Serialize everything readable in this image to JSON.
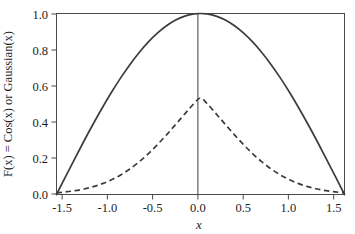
{
  "chart_data": {
    "type": "line",
    "title": "",
    "subtitle": "",
    "xlabel": "x",
    "ylabel": "F(x) = Cos(x) or Gaussian(x)",
    "xlim": [
      -1.5708,
      1.5708
    ],
    "ylim": [
      0.0,
      1.0
    ],
    "grid": false,
    "legend": "none",
    "xticks": [
      -1.5,
      -1.0,
      -0.5,
      0.0,
      0.5,
      1.0,
      1.5
    ],
    "xtick_labels": [
      "-1.5",
      "-1.0",
      "-0.5",
      "0.0",
      "0.5",
      "1.0",
      "1.5"
    ],
    "yticks": [
      0.0,
      0.2,
      0.4,
      0.6,
      0.8,
      1.0
    ],
    "ytick_labels": [
      "0.0",
      "0.2",
      "0.4",
      "0.6",
      "0.8",
      "1.0"
    ],
    "annotations": [
      {
        "name": "vertical-line-at-zero",
        "x": 0.0,
        "style": "solid"
      }
    ],
    "series": [
      {
        "name": "Cos(x)",
        "style": "solid",
        "color": "#3b3b42",
        "x": [
          -1.5708,
          -1.4708,
          -1.3708,
          -1.2708,
          -1.1708,
          -1.0708,
          -0.9708,
          -0.8708,
          -0.7708,
          -0.6708,
          -0.5708,
          -0.4708,
          -0.3708,
          -0.2708,
          -0.1708,
          -0.0708,
          0.0,
          0.0708,
          0.1708,
          0.2708,
          0.3708,
          0.4708,
          0.5708,
          0.6708,
          0.7708,
          0.8708,
          0.9708,
          1.0708,
          1.1708,
          1.2708,
          1.3708,
          1.4708,
          1.5708
        ],
        "values": [
          0.0,
          0.0998,
          0.1987,
          0.2955,
          0.3894,
          0.4794,
          0.5646,
          0.6442,
          0.7174,
          0.7833,
          0.8415,
          0.8912,
          0.932,
          0.9636,
          0.9855,
          0.9975,
          1.0,
          0.9975,
          0.9855,
          0.9636,
          0.932,
          0.8912,
          0.8415,
          0.7833,
          0.7174,
          0.6442,
          0.5646,
          0.4794,
          0.3894,
          0.2955,
          0.1987,
          0.0998,
          0.0
        ]
      },
      {
        "name": "Gaussian(x)",
        "style": "dashed",
        "color": "#3b3b42",
        "peak": 0.8,
        "x": [
          -1.5708,
          -1.4708,
          -1.3708,
          -1.2708,
          -1.1708,
          -1.0708,
          -0.9708,
          -0.8708,
          -0.7708,
          -0.6708,
          -0.5708,
          -0.4708,
          -0.3708,
          -0.2708,
          -0.1708,
          -0.0708,
          0.0,
          0.0708,
          0.1708,
          0.2708,
          0.3708,
          0.4708,
          0.5708,
          0.6708,
          0.7708,
          0.8708,
          0.9708,
          1.0708,
          1.1708,
          1.2708,
          1.3708,
          1.4708,
          1.5708
        ],
        "values": [
          0.0094,
          0.0143,
          0.0211,
          0.0305,
          0.0432,
          0.0599,
          0.0813,
          0.1082,
          0.141,
          0.1799,
          0.2248,
          0.2751,
          0.3297,
          0.3872,
          0.4456,
          0.5027,
          0.5333,
          0.5027,
          0.4456,
          0.3872,
          0.3297,
          0.2751,
          0.2248,
          0.1799,
          0.141,
          0.1082,
          0.0813,
          0.0599,
          0.0432,
          0.0305,
          0.0211,
          0.0143,
          0.0094
        ]
      }
    ]
  },
  "figure": {
    "background_color": "#ffffff",
    "axis_color": "#4a4a50",
    "line_color": "#3b3b42"
  }
}
